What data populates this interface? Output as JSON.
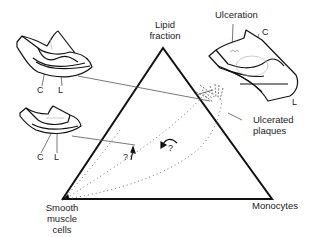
{
  "diagram": {
    "type": "ternary-triangle",
    "vertices": {
      "top": "Lipid fraction",
      "bottom_left": "Smooth muscle cells",
      "bottom_right": "Monocytes"
    },
    "labels": {
      "lipid_line1": "Lipid",
      "lipid_line2": "fraction",
      "smc_line1": "Smooth",
      "smc_line2": "muscle",
      "smc_line3": "cells",
      "monocytes": "Monocytes",
      "ulceration": "Ulceration",
      "ulcerated_line1": "Ulcerated",
      "ulcerated_line2": "plaques",
      "c": "C",
      "l": "L",
      "question": "?"
    },
    "insets": [
      {
        "name": "upper-left vessel section",
        "labels": [
          "C",
          "L"
        ]
      },
      {
        "name": "lower-left vessel section",
        "labels": [
          "C",
          "L"
        ]
      },
      {
        "name": "upper-right ulcerated vessel section",
        "labels": [
          "Ulceration",
          "C",
          "L"
        ]
      }
    ],
    "annotations": [
      "? arrow up",
      "? curved arrow"
    ]
  },
  "colors": {
    "line": "#111111",
    "thin": "#555555",
    "dots": "#666666"
  }
}
